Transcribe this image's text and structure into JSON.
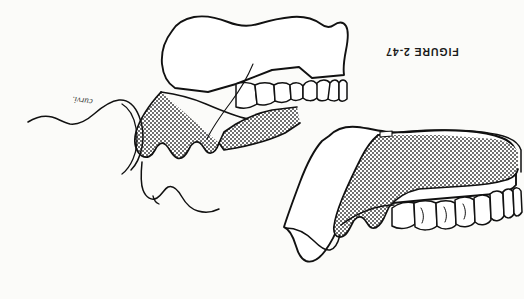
{
  "page": {
    "title": "FIGURE 2-47",
    "kind": "scanned-textbook-figure",
    "orientation": "upside-down",
    "width": 524,
    "height": 299,
    "background_color": "#fbfbf9",
    "ink_color": "#111111",
    "stipple_color": "#8b8b8b"
  },
  "caption": {
    "text": "FIGURE 2-47",
    "rotation_degrees": 180
  },
  "annotation": {
    "text": "curvi.",
    "rotation_degrees": 187,
    "style": "handwritten-cursive"
  },
  "illustrations": [
    {
      "id": "upper-figure",
      "name": "maxillary-sagittal-section-with-facial-profile",
      "description": "Sagittal section of maxilla with shaded (stippled) denture-bearing area, anterior and posterior teeth, and an outline of the facial soft-tissue profile (nose, lip, chin) extending to the left.",
      "shaded_region_label": "stippled denture base / palatal mucosa",
      "teeth_count": 7
    },
    {
      "id": "lower-figure",
      "name": "maxillary-sagittal-section-with-tuberosity",
      "description": "Sagittal section of maxilla with stippled denture base, full row of maxillary teeth along the lower border, and pterygoid / tuberosity region at lower left.",
      "shaded_region_label": "stippled denture base / palatal mucosa",
      "teeth_count": 8
    }
  ],
  "figure_elements": {
    "shading_pattern": "fine checkerboard halftone stipple",
    "line_style": "hand-inked contour outline",
    "line_weights": [
      "1.8px outer contour",
      "1.1px inner detail"
    ]
  }
}
